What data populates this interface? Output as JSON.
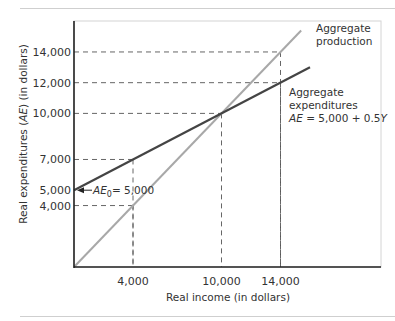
{
  "chart_data": {
    "type": "line",
    "title": "",
    "xlabel": "Real income (in dollars)",
    "ylabel_parts": [
      "Real expenditures (",
      "AE",
      ") (in dollars)"
    ],
    "ylabel": "Real expenditures (AE) (in dollars)",
    "xlim": [
      0,
      20800
    ],
    "ylim": [
      0,
      15400
    ],
    "x_ticks": [
      {
        "value": 4000,
        "label": "4,000"
      },
      {
        "value": 10000,
        "label": "10,000"
      },
      {
        "value": 14000,
        "label": "14,000"
      }
    ],
    "y_ticks": [
      {
        "value": 4000,
        "label": "4,000"
      },
      {
        "value": 5000,
        "label": "5,000"
      },
      {
        "value": 7000,
        "label": "7,000"
      },
      {
        "value": 10000,
        "label": "10,000"
      },
      {
        "value": 12000,
        "label": "12,000"
      },
      {
        "value": 14000,
        "label": "14,000"
      }
    ],
    "series": [
      {
        "name": "Aggregate production",
        "label_lines": [
          "Aggregate",
          "production"
        ],
        "color": "#a8a8a8",
        "x": [
          0,
          15400
        ],
        "y": [
          0,
          15400
        ]
      },
      {
        "name": "Aggregate expenditures",
        "label_lines": [
          "Aggregate",
          "expenditures"
        ],
        "equation": "AE = 5,000 + 0.5Y",
        "color": "#444444",
        "x": [
          0,
          16000
        ],
        "y": [
          5000,
          13000
        ]
      }
    ],
    "annotations": {
      "intercept": {
        "text_sym": "AE",
        "text_sub": "0",
        "text_rest": "= 5,000",
        "x": 0,
        "y": 5000
      },
      "equilibrium": {
        "x": 10000,
        "y": 10000
      }
    },
    "guides": [
      {
        "x": 4000,
        "y": 7000
      },
      {
        "x": 4000,
        "y": 4000
      },
      {
        "x": 10000,
        "y": 10000
      },
      {
        "x": 14000,
        "y": 14000
      },
      {
        "x": 14000,
        "y": 12000
      }
    ],
    "grid": false,
    "legend": "inline labels"
  }
}
